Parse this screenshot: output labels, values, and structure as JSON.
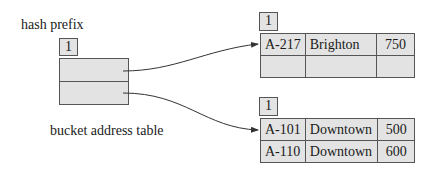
{
  "diagram": {
    "hash_prefix_label": "hash prefix",
    "hash_prefix_value": "1",
    "bucket_address_table_label": "bucket address table",
    "bucket_address_table_entries": 2,
    "buckets": [
      {
        "local_depth": "1",
        "rows": [
          {
            "account": "A-217",
            "branch": "Brighton",
            "balance": "750"
          },
          {
            "account": "",
            "branch": "",
            "balance": ""
          }
        ]
      },
      {
        "local_depth": "1",
        "rows": [
          {
            "account": "A-101",
            "branch": "Downtown",
            "balance": "500"
          },
          {
            "account": "A-110",
            "branch": "Downtown",
            "balance": "600"
          }
        ]
      }
    ],
    "pointers": [
      {
        "from": "bucket-address-entry-0",
        "to": "bucket-0"
      },
      {
        "from": "bucket-address-entry-1",
        "to": "bucket-1"
      }
    ],
    "colors": {
      "cell_fill": "#e3e3e3",
      "border": "#555555",
      "line": "#333333",
      "text": "#1a1a1a"
    }
  }
}
